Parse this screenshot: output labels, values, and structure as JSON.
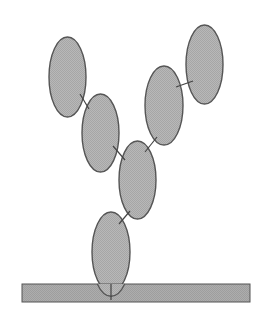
{
  "diagram": {
    "width": 264,
    "height": 319,
    "colors": {
      "fill": "#b3b3b3",
      "bar_fill": "#a9a9a9",
      "stroke": "#555555",
      "connector": "#444444",
      "background": "#ffffff"
    },
    "surface": {
      "x": 22,
      "y": 284,
      "width": 228,
      "height": 18
    },
    "stem": {
      "x1": 111,
      "y1": 284,
      "x2": 111,
      "y2": 300
    },
    "ellipses": [
      {
        "id": "upper-left",
        "cx": 67.5,
        "cy": 77,
        "rx": 18.5,
        "ry": 40
      },
      {
        "id": "mid-left",
        "cx": 100.5,
        "cy": 133,
        "rx": 18.5,
        "ry": 39
      },
      {
        "id": "center",
        "cx": 137.5,
        "cy": 180,
        "rx": 18.5,
        "ry": 39
      },
      {
        "id": "mid-right",
        "cx": 164,
        "cy": 105.5,
        "rx": 19,
        "ry": 39.5
      },
      {
        "id": "upper-right",
        "cx": 204.5,
        "cy": 64.5,
        "rx": 18.5,
        "ry": 39.5
      },
      {
        "id": "base",
        "cx": 111,
        "cy": 252,
        "rx": 19,
        "ry": 40
      }
    ],
    "connectors": [
      {
        "id": "upper-left-to-mid-left",
        "x1": 80,
        "y1": 94,
        "x2": 89,
        "y2": 109
      },
      {
        "id": "mid-left-to-center",
        "x1": 113,
        "y1": 146,
        "x2": 125,
        "y2": 160
      },
      {
        "id": "mid-right-to-center",
        "x1": 157,
        "y1": 137,
        "x2": 145,
        "y2": 152
      },
      {
        "id": "mid-right-to-upper-right",
        "x1": 176,
        "y1": 87,
        "x2": 193,
        "y2": 81
      },
      {
        "id": "center-to-base",
        "x1": 130,
        "y1": 211,
        "x2": 119,
        "y2": 224
      }
    ]
  }
}
